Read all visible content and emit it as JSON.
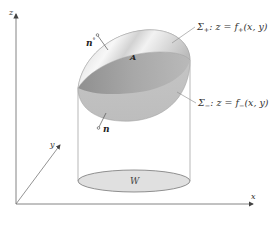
{
  "figure": {
    "axes": {
      "z_label": "z",
      "x_label": "x",
      "y_label": "y"
    },
    "surfaces": {
      "upper": {
        "symbol": "Σ",
        "sub": "+",
        "equation": ": z = f",
        "eq_sub": "+",
        "args": "(x, y)"
      },
      "lower": {
        "symbol": "Σ",
        "sub": "−",
        "equation": ": z = f",
        "eq_sub": "−",
        "args": "(x, y)"
      }
    },
    "volume_label": "A",
    "region_label": "W",
    "normals": {
      "top": {
        "label": "n",
        "sup": "°"
      },
      "bottom": {
        "label": "n",
        "sup": "°"
      }
    },
    "colors": {
      "axis": "#555555",
      "surface_light": "#e6e6e6",
      "surface_mid": "#bdbdbd",
      "surface_dark": "#8f8f8f",
      "base_fill": "#e2e2e2",
      "base_stroke": "#777777"
    }
  }
}
